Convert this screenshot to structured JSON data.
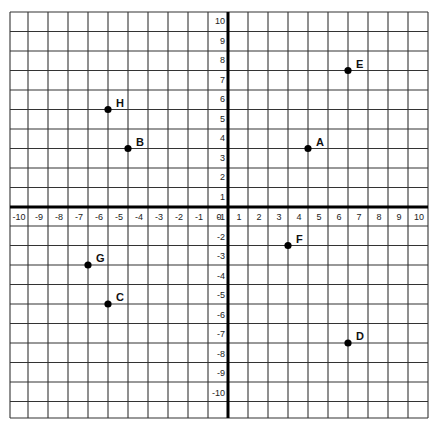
{
  "chart_data": {
    "type": "scatter",
    "title": "",
    "xlabel": "",
    "ylabel": "",
    "xlim": [
      -10,
      10
    ],
    "ylim": [
      -10,
      10
    ],
    "grid": true,
    "x_ticks": [
      -10,
      -9,
      -8,
      -7,
      -6,
      -5,
      -4,
      -3,
      -2,
      -1,
      0,
      1,
      2,
      3,
      4,
      5,
      6,
      7,
      8,
      9,
      10
    ],
    "y_ticks": [
      10,
      9,
      8,
      7,
      6,
      5,
      4,
      3,
      2,
      1,
      -1,
      -2,
      -3,
      -4,
      -5,
      -6,
      -7,
      -8,
      -9,
      -10
    ],
    "points": [
      {
        "label": "A",
        "x": 4,
        "y": 3
      },
      {
        "label": "B",
        "x": -5,
        "y": 3
      },
      {
        "label": "C",
        "x": -6,
        "y": -5
      },
      {
        "label": "D",
        "x": 6,
        "y": -7
      },
      {
        "label": "E",
        "x": 6,
        "y": 7
      },
      {
        "label": "F",
        "x": 3,
        "y": -2
      },
      {
        "label": "G",
        "x": -7,
        "y": -3
      },
      {
        "label": "H",
        "x": -6,
        "y": 5
      }
    ]
  },
  "colors": {
    "grid": "#333333",
    "axis": "#000000",
    "point": "#000000",
    "background": "#ffffff"
  }
}
